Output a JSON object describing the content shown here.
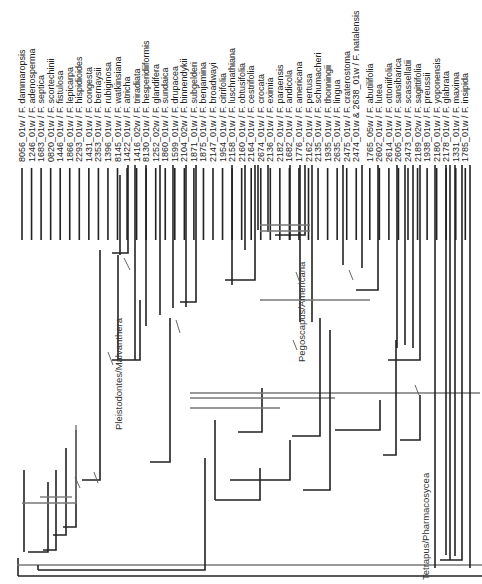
{
  "figure": {
    "type": "phylogenetic-tree",
    "orientation": "root-bottom, tips-top, labels rotated 90deg",
    "taxa": [
      "8056_01w / F. dammaropsis",
      "1246_01w / F. adenosperma",
      "1683_01w / F. septica",
      "0820_01w / F. scortechinii",
      "1446_01w / F. fistulosa",
      "1866_01w / F. lepicarpa",
      "2293_01w / F. hispidioides",
      "1431_01w / F. congesta",
      "2353_01w / F. bernaysii",
      "1396_01w / F. rubiginosa",
      "8145_01w / F. watkinsiana",
      "1422_01w / F. atricha",
      "1416_02w / F. triradiata",
      "8130_01w / F. hesperidiiformis",
      "1252_02w / F. glandifera",
      "1860_01w / F. sundaica",
      "1599_01w / F. drupacea",
      "2104_02w / F. binnendykii",
      "1871_01w / F. subgelderi",
      "1875_01w / F. benjamina",
      "2147_01w / F. broadwayi",
      "1954_01w / F. citrifolia",
      "2158_01w / F. luschnathiana",
      "2160_01w / F. obtusifolia",
      "2164_01w / F. cestrifolia",
      "2674_01w / F. crocata",
      "2136_01w / F. eximia",
      "2182_01w / F. paraensis",
      "1682_01w / F. andicola",
      "1776_01w / F. americana",
      "2162_01w / F. pertusa",
      "2135_01w / F. schumacheri",
      "1935_01w / F. thonningii",
      "2635_01w / F. lingua",
      "2475_01w / F. craterostoma",
      "2474_01w & 2638_01w / F. natalensis",
      "1765_05w / F. abutilifolia",
      "2602_01w / F. lutea",
      "2614_01w / F. ottoniifolia",
      "2605_01w / F. sansibarica",
      "2473_01w / F. scassellatii",
      "2189_02w / F. sagittifolia",
      "1938_01w / F. preussii",
      "2180_01w / F. yoponensis",
      "2178_01w / F. glabrata",
      "1331_01w / F. maxima",
      "1785_01w / F. insipida"
    ],
    "clade_labels": [
      {
        "name": "Pleistodontes/Malvanthera",
        "x": 122,
        "y": 430
      },
      {
        "name": "Pegoscapus/Americana",
        "x": 305,
        "y": 362
      },
      {
        "name": "Tetrapus/Pharmacosycea",
        "x": 429,
        "y": 580
      }
    ],
    "colors": {
      "branch": "#222222",
      "secondary_branch": "#777777",
      "label": "#222222",
      "background": "#ffffff"
    }
  }
}
